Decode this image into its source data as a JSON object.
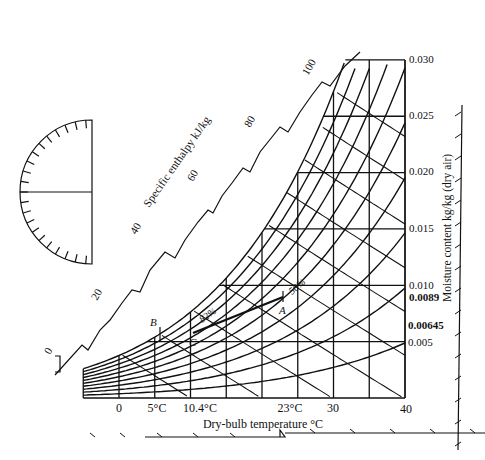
{
  "chart_data": {
    "type": "line",
    "xlabel": "Dry-bulb temperature °C",
    "ylabel": "Moisture content kg/kg (dry air)",
    "enthalpy_label": "Specific enthalpy kJ/kg",
    "x_ticks": [
      "0",
      "5°C",
      "10.4°C",
      "23°C",
      "30",
      "40"
    ],
    "y_ticks": [
      "0.030",
      "0.025",
      "0.020",
      "0.015",
      "0.010",
      "0.0089",
      "0.00645",
      "0.005"
    ],
    "enthalpy_ticks": [
      "0",
      "20",
      "40",
      "60",
      "80",
      "100"
    ],
    "xlim": [
      -5,
      40
    ],
    "ylim": [
      0,
      0.03
    ],
    "points": [
      {
        "label": "A",
        "temp": 23,
        "moisture": 0.0089
      },
      {
        "label": "B",
        "temp": 5,
        "moisture": 0.00645
      },
      {
        "label": "C",
        "temp": 10.4,
        "moisture": 0.00645
      }
    ],
    "rh_labels": [
      "82%",
      "50%"
    ],
    "process_line": {
      "from": "A",
      "to": "C"
    }
  },
  "labels": {
    "xlabel": "Dry-bulb temperature °C",
    "ylabel": "Moisture content kg/kg (dry air)",
    "enthalpy": "Specific enthalpy kJ/kg",
    "x0": "0",
    "x5": "5°C",
    "x10": "10.4°C",
    "x23": "23°C",
    "x30": "30",
    "x40": "40",
    "y030": "0.030",
    "y025": "0.025",
    "y020": "0.020",
    "y015": "0.015",
    "y010": "0.010",
    "y0089": "0.0089",
    "y00645": "0.00645",
    "y005": "0.005",
    "h0": "0",
    "h20": "20",
    "h40": "40",
    "h60": "60",
    "h80": "80",
    "h100": "100",
    "pA": "A",
    "pB": "B",
    "pC": "C",
    "rh82": "82%",
    "rh50": "50%"
  }
}
